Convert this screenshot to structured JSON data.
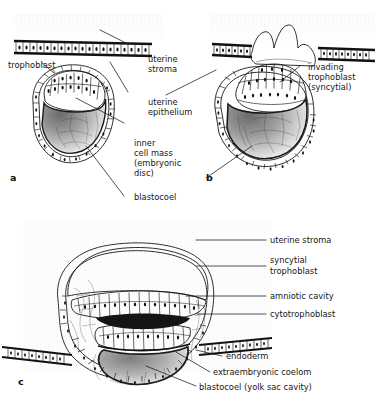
{
  "figure": {
    "title_faint": "",
    "panels": [
      {
        "id": "a",
        "letter": "a",
        "caption": "Blastocyst apposed to uterine epithelium before implantation"
      },
      {
        "id": "b",
        "letter": "b",
        "caption": "Blastocyst invading the uterine epithelium"
      },
      {
        "id": "c",
        "letter": "c",
        "caption": "Implanted embryo with amniotic cavity and yolk sac"
      }
    ],
    "labels_panel_a": [
      {
        "id": "trophoblast",
        "text": "trophoblast"
      }
    ],
    "labels_center": [
      {
        "id": "uterine-stroma",
        "line1": "uterine",
        "line2": "stroma"
      },
      {
        "id": "uterine-epithelium",
        "line1": "uterine",
        "line2": "epithelium"
      },
      {
        "id": "inner-cell-mass",
        "line1": "inner",
        "line2": "cell mass",
        "line3": "(embryonic",
        "line4": "disc)"
      },
      {
        "id": "blastocoel",
        "text": "blastocoel"
      }
    ],
    "labels_panel_b": [
      {
        "id": "invading-trophoblast",
        "line1": "invading",
        "line2": "trophoblast",
        "line3": "(syncytial)"
      }
    ],
    "labels_panel_c": [
      {
        "id": "uterine-stroma-c",
        "text": "uterine stroma"
      },
      {
        "id": "syncytial-trophoblast",
        "line1": "syncytial",
        "line2": "trophoblast"
      },
      {
        "id": "amniotic-cavity",
        "text": "amniotic cavity"
      },
      {
        "id": "cytotrophoblast",
        "text": "cytotrophoblast"
      },
      {
        "id": "endoderm",
        "text": "endoderm"
      },
      {
        "id": "extraembryonic-coelom",
        "text": "extraembryonic coelom"
      },
      {
        "id": "blastocoel-yolk",
        "text": "blastocoel (yolk sac cavity)"
      }
    ],
    "colors": {
      "ink": "#1a1a1a",
      "paper": "#ffffff",
      "stroma_stipple": "#b9b9b9",
      "shading_dark": "#4a4a4a"
    }
  }
}
